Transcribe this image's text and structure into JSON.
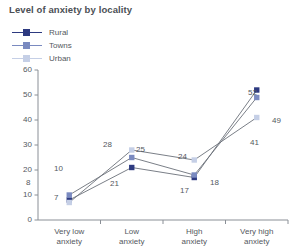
{
  "chart_data": {
    "type": "line",
    "title": "Level of anxiety by locality",
    "xlabel": "",
    "ylabel": "",
    "ylim": [
      0,
      60
    ],
    "yticks": [
      0,
      10,
      20,
      30,
      40,
      50,
      60
    ],
    "grid": false,
    "legend_position": "top-left",
    "categories": [
      "Very low anxiety",
      "Low anxiety",
      "High anxiety",
      "Very high anxiety"
    ],
    "category_lines": [
      [
        "Very low",
        "anxiety"
      ],
      [
        "Low",
        "anxiety"
      ],
      [
        "High",
        "anxiety"
      ],
      [
        "Very high",
        "anxiety"
      ]
    ],
    "series": [
      {
        "name": "Rural",
        "color": "#2d3a80",
        "marker": "square",
        "values": [
          8,
          21,
          17,
          52
        ]
      },
      {
        "name": "Towns",
        "color": "#7a8ac0",
        "marker": "square",
        "values": [
          10,
          25,
          18,
          49
        ]
      },
      {
        "name": "Urban",
        "color": "#c5cfe6",
        "marker": "square",
        "values": [
          7,
          28,
          24,
          41
        ]
      }
    ],
    "line_color": "#6b7079",
    "axis_color": "#8a8f96"
  },
  "value_labels": [
    {
      "text": "8",
      "x": 26,
      "y": 178
    },
    {
      "text": "10",
      "x": 54,
      "y": 164
    },
    {
      "text": "7",
      "x": 54,
      "y": 193
    },
    {
      "text": "28",
      "x": 103,
      "y": 140
    },
    {
      "text": "25",
      "x": 136,
      "y": 145
    },
    {
      "text": "21",
      "x": 110,
      "y": 179
    },
    {
      "text": "24",
      "x": 178,
      "y": 152
    },
    {
      "text": "18",
      "x": 210,
      "y": 178
    },
    {
      "text": "17",
      "x": 180,
      "y": 186
    },
    {
      "text": "52",
      "x": 248,
      "y": 88
    },
    {
      "text": "49",
      "x": 272,
      "y": 116
    },
    {
      "text": "41",
      "x": 250,
      "y": 138
    }
  ]
}
